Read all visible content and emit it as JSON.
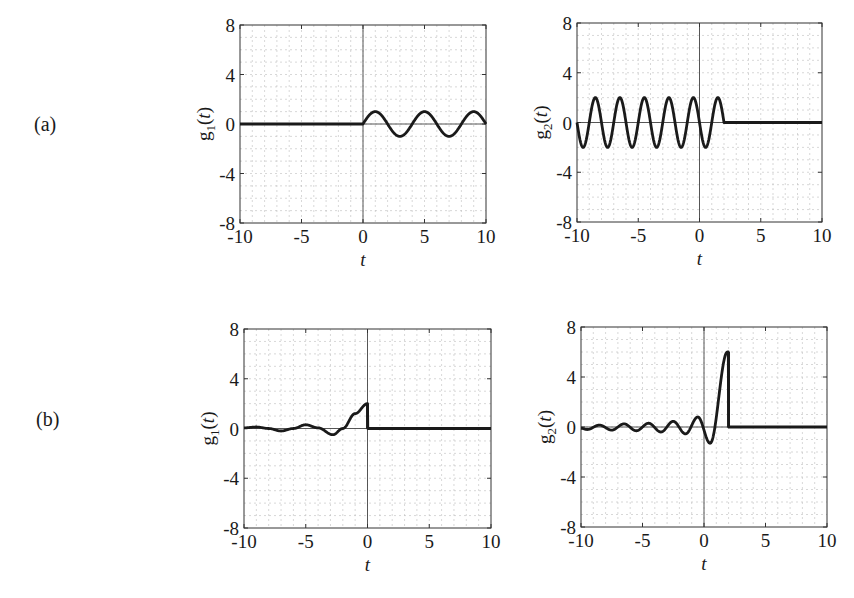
{
  "rows": [
    {
      "label": "(a)"
    },
    {
      "label": "(b)"
    }
  ],
  "chart_data": [
    {
      "id": "a-g1",
      "type": "line",
      "row": "(a)",
      "title": "",
      "xlabel": "t",
      "ylabel": "g1(t)",
      "xlim": [
        -10,
        10
      ],
      "ylim": [
        -8,
        8
      ],
      "xticks": [
        -10,
        -5,
        0,
        5,
        10
      ],
      "yticks": [
        -8,
        -4,
        0,
        4,
        8
      ],
      "grid": true,
      "description": "0 for t<0; sin(pi t/2) for t>=0 (amplitude 1, period 4)",
      "x": [
        -10,
        0,
        1,
        2,
        3,
        4,
        5,
        6,
        7,
        8,
        9,
        10
      ],
      "values": [
        0,
        0,
        1,
        0,
        -1,
        0,
        1,
        0,
        -1,
        0,
        1,
        0
      ]
    },
    {
      "id": "a-g2",
      "type": "line",
      "row": "(a)",
      "title": "",
      "xlabel": "t",
      "ylabel": "g2(t)",
      "xlim": [
        -10,
        10
      ],
      "ylim": [
        -8,
        8
      ],
      "xticks": [
        -10,
        -5,
        0,
        5,
        10
      ],
      "yticks": [
        -8,
        -4,
        0,
        4,
        8
      ],
      "grid": true,
      "description": "-2 sin(pi t) for t<2; 0 for t>=2 (amplitude 2, period 2)",
      "x": [
        -10,
        -9.5,
        -8.5,
        -7.5,
        -6.5,
        -5.5,
        -4.5,
        -3.5,
        -2.5,
        -1.5,
        -0.5,
        0.5,
        1.5,
        2,
        10
      ],
      "values": [
        0,
        -2,
        2,
        -2,
        2,
        -2,
        2,
        -2,
        2,
        -2,
        2,
        -2,
        2,
        0,
        0
      ]
    },
    {
      "id": "b-g1",
      "type": "line",
      "row": "(b)",
      "title": "",
      "xlabel": "t",
      "ylabel": "g1(t)",
      "xlim": [
        -10,
        10
      ],
      "ylim": [
        -8,
        8
      ],
      "xticks": [
        -10,
        -5,
        0,
        5,
        10
      ],
      "yticks": [
        -8,
        -4,
        0,
        4,
        8
      ],
      "grid": true,
      "description": "damped oscillation for t<0 rising to 2 at t=0, then 0 for t>0",
      "x": [
        -10,
        -9,
        -7,
        -5,
        -2.8,
        -1,
        0,
        0,
        10
      ],
      "values": [
        0.05,
        0.12,
        -0.2,
        0.3,
        -0.5,
        1.2,
        2,
        0,
        0
      ]
    },
    {
      "id": "b-g2",
      "type": "line",
      "row": "(b)",
      "title": "",
      "xlabel": "t",
      "ylabel": "g2(t)",
      "xlim": [
        -10,
        10
      ],
      "ylim": [
        -8,
        8
      ],
      "xticks": [
        -10,
        -5,
        0,
        5,
        10
      ],
      "yticks": [
        -8,
        -4,
        0,
        4,
        8
      ],
      "grid": true,
      "description": "growing oscillation (period 2) for t<2, peaks at 6 near t=1.9, then 0 for t>=2",
      "x": [
        -10,
        -9.5,
        -8.5,
        -7.5,
        -6.5,
        -5.5,
        -4.5,
        -3.5,
        -2.5,
        -1.5,
        -0.5,
        0.5,
        1.9,
        2,
        2,
        10
      ],
      "values": [
        -0.1,
        -0.2,
        0.15,
        -0.25,
        0.25,
        -0.3,
        0.3,
        -0.4,
        0.45,
        -0.55,
        0.8,
        -1.3,
        6,
        6,
        0,
        0
      ]
    }
  ]
}
